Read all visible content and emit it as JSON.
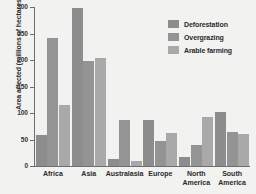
{
  "chart_data": {
    "type": "bar",
    "title": "",
    "xlabel": "",
    "ylabel": "Area affected (millions of hectares)",
    "ylim": [
      0,
      300
    ],
    "yticks": [
      0,
      50,
      100,
      150,
      200,
      250,
      300
    ],
    "ytick_labels": [
      "0",
      "50",
      "100",
      "150",
      "200",
      "250",
      "300"
    ],
    "grid": false,
    "legend_position": "top-right",
    "categories": [
      "Africa",
      "Asia",
      "Australasia",
      "Europe",
      "North\nAmerica",
      "South\nAmerica"
    ],
    "series": [
      {
        "name": "Deforestation",
        "color": "#8d8d8d",
        "values": [
          58,
          298,
          14,
          87,
          17,
          101
        ]
      },
      {
        "name": "Overgrazing",
        "color": "#949494",
        "values": [
          242,
          199,
          87,
          48,
          40,
          64
        ]
      },
      {
        "name": "Arable farming",
        "color": "#a9a9a9",
        "values": [
          115,
          204,
          9,
          62,
          92,
          61
        ]
      }
    ]
  },
  "colors": {
    "background": "#f2f2f0",
    "axis": "#6e6e6e",
    "text": "#2b2b2b"
  }
}
